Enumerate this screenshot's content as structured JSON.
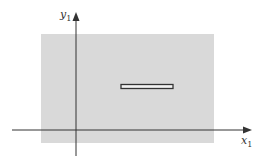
{
  "diagram": {
    "axes": {
      "x_label": "x",
      "x_subscript": "1",
      "y_label": "y",
      "y_subscript": "1"
    },
    "colors": {
      "region_fill": "#d9d9d9",
      "axis_color": "#333333",
      "bar_stroke": "#333333",
      "bar_fill": "#f2f2f2"
    },
    "shapes": {
      "shaded_region": {
        "x": 41,
        "y": 34,
        "width": 173,
        "height": 109
      },
      "bar": {
        "x": 120,
        "y": 84,
        "width": 53,
        "height": 5
      }
    }
  }
}
